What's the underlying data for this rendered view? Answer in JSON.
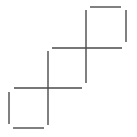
{
  "diagram": {
    "stroke_color": "#4a4a4a",
    "stroke_width": 1.4,
    "lines": [
      {
        "id": "top-square-top",
        "x1": 90,
        "y1": 7,
        "x2": 121,
        "y2": 7
      },
      {
        "id": "top-square-right",
        "x1": 126,
        "y1": 10,
        "x2": 126,
        "y2": 42
      },
      {
        "id": "upper-vertical",
        "x1": 86,
        "y1": 10,
        "x2": 86,
        "y2": 83
      },
      {
        "id": "upper-horizontal",
        "x1": 52,
        "y1": 48,
        "x2": 122,
        "y2": 48
      },
      {
        "id": "lower-vertical",
        "x1": 48,
        "y1": 51,
        "x2": 48,
        "y2": 125
      },
      {
        "id": "lower-horizontal",
        "x1": 14,
        "y1": 88,
        "x2": 82,
        "y2": 88
      },
      {
        "id": "bottom-square-left",
        "x1": 9,
        "y1": 92,
        "x2": 9,
        "y2": 124
      },
      {
        "id": "bottom-square-bottom",
        "x1": 13,
        "y1": 128,
        "x2": 44,
        "y2": 128
      }
    ]
  }
}
